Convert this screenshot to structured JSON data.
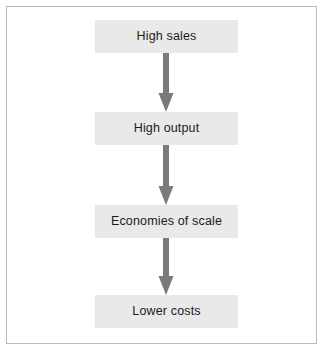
{
  "figure": {
    "type": "flowchart",
    "orientation": "vertical-top-to-bottom",
    "title": "",
    "border_color": "#b9b9b9",
    "background_color": "#ffffff"
  },
  "diagram_data": {
    "type": "flowchart",
    "nodes": [
      {
        "id": "node-0",
        "label": "High sales"
      },
      {
        "id": "node-1",
        "label": "High output"
      },
      {
        "id": "node-2",
        "label": "Economies of scale"
      },
      {
        "id": "node-3",
        "label": "Lower costs"
      }
    ],
    "edges": [
      {
        "id": "arrow-0",
        "from": "node-0",
        "to": "node-1",
        "direction": "down",
        "style": "solid-arrow"
      },
      {
        "id": "arrow-1",
        "from": "node-1",
        "to": "node-2",
        "direction": "down",
        "style": "solid-arrow"
      },
      {
        "id": "arrow-2",
        "from": "node-2",
        "to": "node-3",
        "direction": "down",
        "style": "solid-arrow"
      }
    ],
    "colors": {
      "node_fill": "#e9e9e9",
      "node_text": "#1b1b1b",
      "arrow": "#7a7a7a",
      "frame": "#b9b9b9"
    }
  },
  "icons": {
    "arrow_down": "arrow-down-icon"
  }
}
